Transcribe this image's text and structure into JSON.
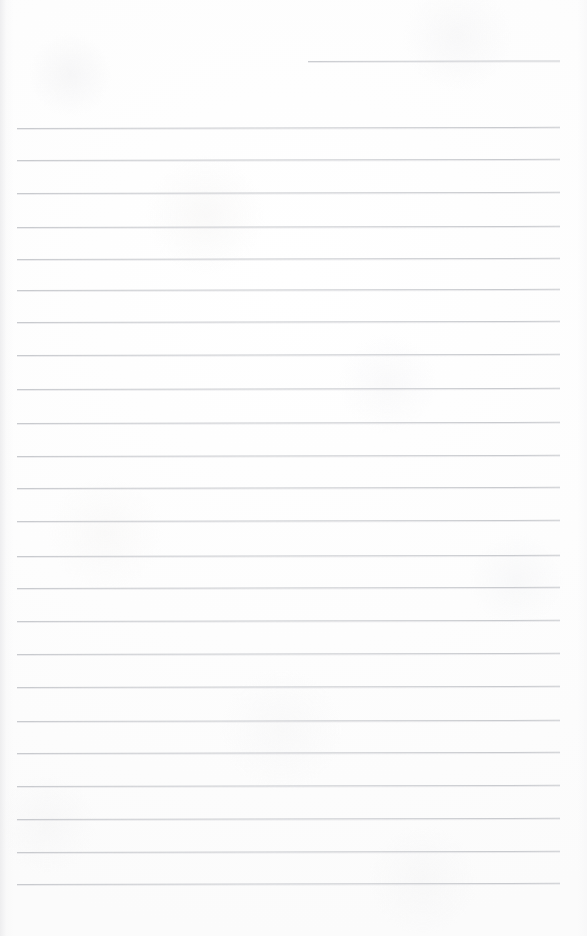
{
  "document": {
    "kind": "scanned-lined-notepad-page",
    "title": "Blank ruled notepad page",
    "width": 587,
    "height": 936,
    "background_color": "#fdfdfd",
    "rule_color": "#c9cbcf",
    "rule_thickness_px": 1,
    "has_text_content": false,
    "text_content": "",
    "skew_degrees": -0.12,
    "margins": {
      "left_px": 17,
      "right_px": 27,
      "top_px": 61,
      "bottom_px": 52
    },
    "line_spacing_px": 31.5,
    "total_rule_count": 26
  },
  "rules": [
    {
      "name": "header-rule",
      "y": 61,
      "x": 308,
      "width": 252,
      "partial": true
    },
    {
      "name": "rule-01",
      "y": 128,
      "x": 17,
      "width": 543,
      "partial": false
    },
    {
      "name": "rule-02",
      "y": 160,
      "x": 17,
      "width": 543,
      "partial": false
    },
    {
      "name": "rule-03",
      "y": 193,
      "x": 17,
      "width": 543,
      "partial": false
    },
    {
      "name": "rule-04",
      "y": 227,
      "x": 17,
      "width": 543,
      "partial": false
    },
    {
      "name": "rule-05",
      "y": 259,
      "x": 17,
      "width": 543,
      "partial": false
    },
    {
      "name": "rule-06",
      "y": 290,
      "x": 17,
      "width": 543,
      "partial": false
    },
    {
      "name": "rule-07",
      "y": 322,
      "x": 17,
      "width": 543,
      "partial": false
    },
    {
      "name": "rule-08",
      "y": 355,
      "x": 17,
      "width": 543,
      "partial": false
    },
    {
      "name": "rule-09",
      "y": 389,
      "x": 17,
      "width": 543,
      "partial": false
    },
    {
      "name": "rule-10",
      "y": 423,
      "x": 17,
      "width": 543,
      "partial": false
    },
    {
      "name": "rule-11",
      "y": 456,
      "x": 17,
      "width": 543,
      "partial": false
    },
    {
      "name": "rule-12",
      "y": 488,
      "x": 17,
      "width": 543,
      "partial": false
    },
    {
      "name": "rule-13",
      "y": 521,
      "x": 17,
      "width": 543,
      "partial": false
    },
    {
      "name": "rule-14",
      "y": 556,
      "x": 17,
      "width": 543,
      "partial": false
    },
    {
      "name": "rule-15",
      "y": 588,
      "x": 17,
      "width": 543,
      "partial": false
    },
    {
      "name": "rule-16",
      "y": 621,
      "x": 17,
      "width": 543,
      "partial": false
    },
    {
      "name": "rule-17",
      "y": 654,
      "x": 17,
      "width": 543,
      "partial": false
    },
    {
      "name": "rule-18",
      "y": 687,
      "x": 17,
      "width": 543,
      "partial": false
    },
    {
      "name": "rule-19",
      "y": 721,
      "x": 17,
      "width": 543,
      "partial": false
    },
    {
      "name": "rule-20",
      "y": 753,
      "x": 17,
      "width": 543,
      "partial": false
    },
    {
      "name": "rule-21",
      "y": 786,
      "x": 17,
      "width": 543,
      "partial": false
    },
    {
      "name": "rule-22",
      "y": 819,
      "x": 17,
      "width": 543,
      "partial": false
    },
    {
      "name": "rule-23",
      "y": 852,
      "x": 17,
      "width": 543,
      "partial": false
    },
    {
      "name": "rule-24",
      "y": 884,
      "x": 17,
      "width": 543,
      "partial": false
    }
  ]
}
